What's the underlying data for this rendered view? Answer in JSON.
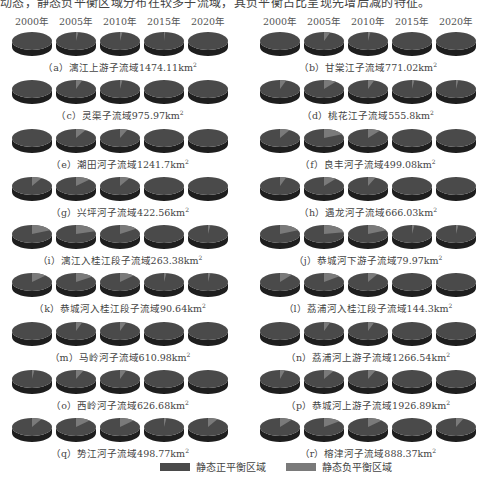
{
  "header_text": "动态，静态负平衡区域分布在较多子流域，其负平衡占比呈现先增后减的特征。",
  "chart_data": {
    "type": "pie",
    "years": [
      "2000年",
      "2005年",
      "2010年",
      "2015年",
      "2020年"
    ],
    "legend": [
      {
        "name": "静态正平衡区域",
        "color": "#4a4a4a"
      },
      {
        "name": "静态负平衡区域",
        "color": "#7a7a7a"
      }
    ],
    "legend_position": "bottom",
    "value_unit": "fraction of area (negative balance share, estimated)",
    "panels": [
      {
        "id": "a",
        "label": "（a）漓江上游子流域1474.11km",
        "negative_share": [
          0,
          0.02,
          0.02,
          0.01,
          0
        ]
      },
      {
        "id": "b",
        "label": "（b）甘棠江子流域771.02km",
        "negative_share": [
          0,
          0.05,
          0.02,
          0,
          0
        ]
      },
      {
        "id": "c",
        "label": "（c）灵渠子流域975.97km",
        "negative_share": [
          0,
          0.05,
          0.02,
          0,
          0
        ]
      },
      {
        "id": "d",
        "label": "（d）桃花江子流域555.8km",
        "negative_share": [
          0.05,
          0.1,
          0.05,
          0.02,
          0.02
        ]
      },
      {
        "id": "e",
        "label": "（e）潮田河子流域1241.7km",
        "negative_share": [
          0,
          0.08,
          0.06,
          0,
          0
        ]
      },
      {
        "id": "f",
        "label": "（f）良丰河子流域499.08km",
        "negative_share": [
          0.08,
          0.18,
          0.1,
          0,
          0
        ]
      },
      {
        "id": "g",
        "label": "（g）兴坪河子流域422.56km",
        "negative_share": [
          0.08,
          0.12,
          0.08,
          0,
          0
        ]
      },
      {
        "id": "h",
        "label": "（h）遇龙河子流域666.03km",
        "negative_share": [
          0.05,
          0.1,
          0.06,
          0,
          0
        ]
      },
      {
        "id": "i",
        "label": "（i）漓江入桂江段子流域263.38km",
        "negative_share": [
          0.18,
          0.2,
          0.15,
          0,
          0.02
        ]
      },
      {
        "id": "j",
        "label": "（j）恭城河下游子流域79.97km",
        "negative_share": [
          0.18,
          0.22,
          0.18,
          0.02,
          0.02
        ]
      },
      {
        "id": "k",
        "label": "（k）恭城河入桂江段子流域90.64km",
        "negative_share": [
          0.12,
          0.15,
          0.12,
          0.02,
          0.02
        ]
      },
      {
        "id": "l",
        "label": "（l）荔浦河入桂江段子流域144.3km",
        "negative_share": [
          0.1,
          0.14,
          0.08,
          0,
          0
        ]
      },
      {
        "id": "m",
        "label": "（m）马岭河子流域610.98km",
        "negative_share": [
          0,
          0.05,
          0.05,
          0,
          0
        ]
      },
      {
        "id": "n",
        "label": "（n）荔浦河上游子流域1266.54km",
        "negative_share": [
          0,
          0.05,
          0.05,
          0,
          0
        ]
      },
      {
        "id": "o",
        "label": "（o）西岭河子流域626.68km",
        "negative_share": [
          0.02,
          0.06,
          0.05,
          0,
          0
        ]
      },
      {
        "id": "p",
        "label": "（p）恭城河上游子流域1926.89km",
        "negative_share": [
          0.04,
          0.08,
          0.06,
          0,
          0
        ]
      },
      {
        "id": "q",
        "label": "（q）势江河子流域498.77km",
        "negative_share": [
          0.08,
          0.12,
          0.12,
          0.02,
          0.08
        ]
      },
      {
        "id": "r",
        "label": "（r）榕津河子流域888.37km",
        "negative_share": [
          0.1,
          0.14,
          0.12,
          0,
          0.06
        ]
      }
    ],
    "superscript": "2"
  }
}
